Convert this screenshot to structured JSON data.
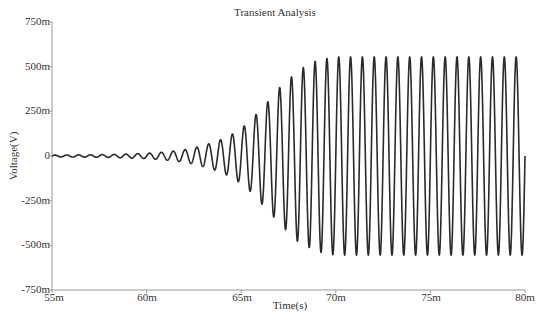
{
  "chart_data": {
    "type": "line",
    "title": "Transient Analysis",
    "xlabel": "Time(s)",
    "ylabel": "Voltage(V)",
    "xlim": [
      0.055,
      0.08
    ],
    "ylim": [
      -0.75,
      0.75
    ],
    "x_ticks": [
      "55m",
      "60m",
      "65m",
      "70m",
      "75m",
      "80m"
    ],
    "y_ticks": [
      "750m",
      "500m",
      "250m",
      "0",
      "-250m",
      "-500m",
      "-750m"
    ],
    "grid": false,
    "legend": null,
    "series": [
      {
        "name": "V(out)",
        "description": "Growing sinusoidal oscillation that saturates at about ±0.555 V after ~69 ms",
        "frequency_hz": 1600,
        "steady_state_amplitude_v": 0.555,
        "envelope_points": [
          {
            "t": 0.055,
            "amp": 0.005
          },
          {
            "t": 0.058,
            "amp": 0.008
          },
          {
            "t": 0.06,
            "amp": 0.015
          },
          {
            "t": 0.062,
            "amp": 0.035
          },
          {
            "t": 0.063,
            "amp": 0.06
          },
          {
            "t": 0.064,
            "amp": 0.095
          },
          {
            "t": 0.065,
            "amp": 0.155
          },
          {
            "t": 0.066,
            "amp": 0.26
          },
          {
            "t": 0.067,
            "amp": 0.38
          },
          {
            "t": 0.068,
            "amp": 0.48
          },
          {
            "t": 0.069,
            "amp": 0.535
          },
          {
            "t": 0.07,
            "amp": 0.555
          },
          {
            "t": 0.08,
            "amp": 0.555
          }
        ]
      }
    ]
  },
  "plot": {
    "left_px": 52,
    "right_px": 525,
    "top_px": 22,
    "bottom_px": 290,
    "line_color": "#2a2a2a",
    "axis_color": "#999999"
  }
}
